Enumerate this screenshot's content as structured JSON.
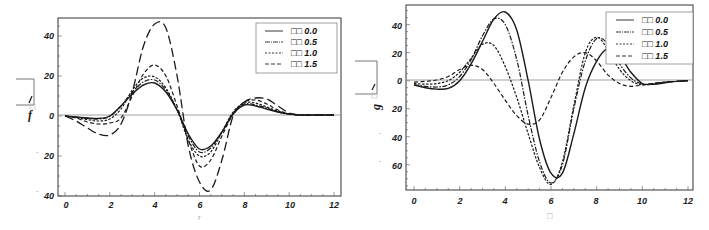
{
  "chart_data": [
    {
      "type": "line",
      "title": "",
      "xlabel": "r",
      "ylabel": "f",
      "xlim": [
        0,
        12
      ],
      "ylim": [
        -40,
        49
      ],
      "xticks": [
        0,
        2,
        4,
        6,
        8,
        10,
        12
      ],
      "yticks": [
        40,
        20,
        0,
        20,
        40
      ],
      "ytick_values": [
        40,
        20,
        0,
        -20,
        -40
      ],
      "grid": false,
      "legend_position": "upper-right",
      "x": [
        0,
        0.5,
        1,
        1.5,
        2,
        2.5,
        3,
        3.5,
        4,
        4.5,
        5,
        5.5,
        6,
        6.5,
        7,
        7.5,
        8,
        8.5,
        9,
        9.5,
        10,
        10.5,
        11,
        11.5,
        12
      ],
      "series": [
        {
          "name": "0.0",
          "legend_label": "□□ 0.0",
          "style": "solid",
          "values": [
            0,
            -0.5,
            -1,
            -1.2,
            0,
            5,
            11,
            15.5,
            16.5,
            12,
            3,
            -9,
            -16.5,
            -15,
            -8,
            1,
            5.5,
            5,
            3.5,
            2,
            1,
            0.5,
            0.5,
            0.5,
            0.5
          ]
        },
        {
          "name": "0.5",
          "legend_label": "□□ 0.5",
          "style": "dash-dot",
          "values": [
            0,
            -0.6,
            -1.2,
            -1.5,
            -0.2,
            5,
            12,
            17,
            18,
            13,
            3,
            -10,
            -18,
            -16,
            -8,
            1.5,
            6,
            5.5,
            4,
            2,
            1,
            0.5,
            0.5,
            0.5,
            0.5
          ]
        },
        {
          "name": "1.0",
          "legend_label": "□□ 1.0",
          "style": "dotted",
          "values": [
            0,
            -0.8,
            -1.8,
            -2.5,
            -1.5,
            3.5,
            13,
            19,
            19.5,
            14,
            3,
            -12,
            -20,
            -18,
            -8,
            2,
            6.5,
            6.5,
            4.5,
            2.5,
            1,
            0.5,
            0.5,
            0.5,
            0.5
          ]
        },
        {
          "name": "1.5",
          "legend_label": "□□ 1.5",
          "style": "dashed",
          "values": [
            0,
            -1,
            -3,
            -4,
            -3.5,
            -1,
            10,
            21,
            25.5,
            20,
            5,
            -12,
            -25,
            -22,
            -10,
            1,
            7,
            8,
            6,
            3,
            1,
            0.5,
            0.5,
            0.5,
            0.5
          ]
        },
        {
          "name": "extra",
          "legend_label": "",
          "style": "long-dash",
          "values": [
            0,
            -2.5,
            -6,
            -9,
            -9.5,
            -4,
            12,
            35,
            46,
            44,
            20,
            -15,
            -33,
            -37,
            -22,
            0,
            7,
            9,
            8.5,
            5,
            1.5,
            0.5,
            0.5,
            0.5,
            0.5
          ]
        }
      ]
    },
    {
      "type": "line",
      "title": "",
      "xlabel": "□",
      "ylabel": "g",
      "xlim": [
        0,
        12
      ],
      "ylim": [
        -78,
        54
      ],
      "xticks": [
        0,
        2,
        4,
        6,
        8,
        10,
        12
      ],
      "yticks": [
        40,
        20,
        0,
        20,
        40,
        60
      ],
      "ytick_values": [
        40,
        20,
        0,
        -20,
        -40,
        -60
      ],
      "grid": false,
      "legend_position": "upper-right",
      "x": [
        0,
        0.5,
        1,
        1.5,
        2,
        2.5,
        3,
        3.5,
        4,
        4.5,
        5,
        5.5,
        6,
        6.5,
        7,
        7.5,
        8,
        8.5,
        9,
        9.5,
        10,
        10.5,
        11,
        11.5,
        12
      ],
      "series": [
        {
          "name": "0.0",
          "legend_label": "□□ 0.0",
          "style": "solid",
          "values": [
            -3,
            -5,
            -6,
            -5.5,
            0,
            12,
            28,
            44,
            49,
            36,
            0,
            -42,
            -66,
            -66,
            -38,
            -5,
            14,
            23,
            18,
            6,
            -2,
            -2.5,
            -1.5,
            -0.5,
            0
          ]
        },
        {
          "name": "0.5",
          "legend_label": "□□ 0.5",
          "style": "dash-dot",
          "values": [
            -3,
            -4,
            -4.5,
            -3,
            3,
            15,
            32,
            44,
            40,
            15,
            -25,
            -58,
            -73,
            -60,
            -20,
            14,
            30,
            26,
            12,
            2,
            -2.5,
            -2,
            -1,
            -0.5,
            0
          ]
        },
        {
          "name": "1.0",
          "legend_label": "□□ 1.0",
          "style": "dotted",
          "values": [
            -2,
            -2.5,
            -2,
            0,
            6,
            16,
            26,
            25,
            10,
            -12,
            -38,
            -62,
            -74,
            -58,
            -18,
            20,
            31,
            22,
            8,
            0,
            -3,
            -2,
            -1,
            -0.5,
            0
          ]
        },
        {
          "name": "1.5",
          "legend_label": "□□ 1.5",
          "style": "dashed",
          "values": [
            -1,
            -0.5,
            0.5,
            3,
            8,
            11,
            8,
            -2,
            -14,
            -25,
            -31,
            -28,
            -12,
            6,
            17,
            20,
            14,
            4,
            -2,
            -4,
            -3,
            -2,
            -1,
            -0.5,
            0
          ]
        }
      ]
    }
  ],
  "charts": [
    {
      "ylabel": "f",
      "xlabel": "r",
      "xticks": [
        "0",
        "2",
        "4",
        "6",
        "8",
        "10",
        "12"
      ],
      "yticks": [
        "40",
        "20",
        "0",
        "20",
        "40"
      ],
      "legend": [
        "□□ 0.0",
        "□□ 0.5",
        "□□ 1.0",
        "□□ 1.5"
      ]
    },
    {
      "ylabel": "g",
      "xlabel": "□",
      "xticks": [
        "0",
        "2",
        "4",
        "6",
        "8",
        "10",
        "12"
      ],
      "yticks": [
        "40",
        "20",
        "0",
        "20",
        "40",
        "60"
      ],
      "legend": [
        "□□ 0.0",
        "□□ 0.5",
        "□□ 1.0",
        "□□ 1.5"
      ]
    }
  ],
  "colors": {
    "line": "#1a1a1a",
    "axis": "#333333",
    "zero_line": "#888888",
    "legend_border": "#777777"
  }
}
